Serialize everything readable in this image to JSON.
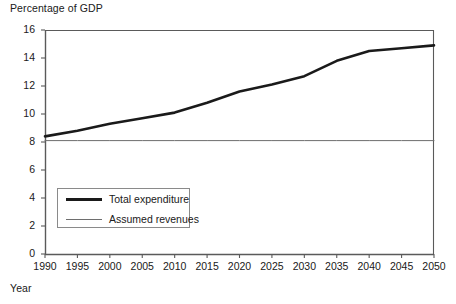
{
  "chart_data": {
    "type": "line",
    "title": "",
    "ylabel": "Percentage of GDP",
    "xlabel": "Year",
    "xlim": [
      1990,
      2050
    ],
    "ylim": [
      0,
      16
    ],
    "grid": false,
    "legend_position": "inside lower-left",
    "x_ticks": [
      1990,
      1995,
      2000,
      2005,
      2010,
      2015,
      2020,
      2025,
      2030,
      2035,
      2040,
      2045,
      2050
    ],
    "y_ticks": [
      0,
      2,
      4,
      6,
      8,
      10,
      12,
      14,
      16
    ],
    "x": [
      1990,
      1995,
      2000,
      2005,
      2010,
      2015,
      2020,
      2025,
      2030,
      2035,
      2040,
      2045,
      2050
    ],
    "series": [
      {
        "name": "Total expenditure",
        "style": "thick",
        "color": "#1a1a1a",
        "values": [
          8.4,
          8.8,
          9.3,
          9.7,
          10.1,
          10.8,
          11.6,
          12.1,
          12.7,
          13.8,
          14.5,
          14.7,
          14.9
        ]
      },
      {
        "name": "Assumed revenues",
        "style": "thin",
        "color": "#6e6e6e",
        "values": [
          8.1,
          8.1,
          8.1,
          8.1,
          8.1,
          8.1,
          8.1,
          8.1,
          8.1,
          8.1,
          8.1,
          8.1,
          8.1
        ]
      }
    ]
  },
  "axis": {
    "y_title": "Percentage of GDP",
    "x_title": "Year",
    "y_tick_labels": [
      "16",
      "14",
      "12",
      "10",
      "8",
      "6",
      "4",
      "2",
      "0"
    ],
    "x_tick_labels": [
      "1990",
      "1995",
      "2000",
      "2005",
      "2010",
      "2015",
      "2020",
      "2025",
      "2030",
      "2035",
      "2040",
      "2045",
      "2050"
    ]
  },
  "legend": {
    "items": [
      {
        "label": "Total expenditure"
      },
      {
        "label": "Assumed revenues"
      }
    ]
  },
  "colors": {
    "expenditure": "#1a1a1a",
    "revenue": "#6e6e6e",
    "axis": "#5a5a5a"
  }
}
